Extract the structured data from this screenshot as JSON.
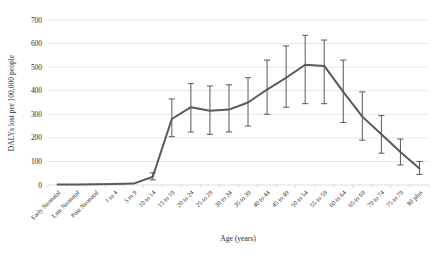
{
  "chart_data": {
    "type": "line",
    "title": "",
    "xlabel": "Age (years)",
    "ylabel": "DALYs lost per 100,000 people",
    "ylim": [
      0,
      700
    ],
    "ytick_values": [
      0,
      100,
      200,
      300,
      400,
      500,
      600,
      700
    ],
    "grid": true,
    "legend": "none",
    "line_color": "#595959",
    "errorbar_color": "#595959",
    "categories": [
      "Early Neonatal",
      "Late Neonatal",
      "Post Neonatal",
      "1 to 4",
      "5 to 9",
      "10 to 14",
      "15 to 19",
      "20 to 24",
      "25 to 29",
      "30 to 34",
      "35 to 39",
      "40 to 44",
      "45 to 49",
      "50 to 54",
      "55 to 59",
      "60 to 64",
      "65 to 69",
      "70 to 74",
      "75 to 79",
      "80 plus"
    ],
    "values": [
      2,
      2,
      3,
      4,
      6,
      35,
      280,
      330,
      315,
      320,
      350,
      405,
      455,
      510,
      505,
      395,
      290,
      215,
      140,
      70
    ],
    "error_low": [
      2,
      2,
      3,
      4,
      6,
      22,
      205,
      225,
      215,
      225,
      250,
      300,
      330,
      345,
      345,
      265,
      190,
      135,
      85,
      45
    ],
    "error_high": [
      2,
      2,
      3,
      4,
      6,
      52,
      365,
      430,
      420,
      425,
      455,
      530,
      590,
      635,
      615,
      530,
      395,
      295,
      195,
      100
    ]
  },
  "axes": {
    "y_axis_title": "DALYs lost per 100,000 people",
    "x_axis_title": "Age (years)"
  }
}
